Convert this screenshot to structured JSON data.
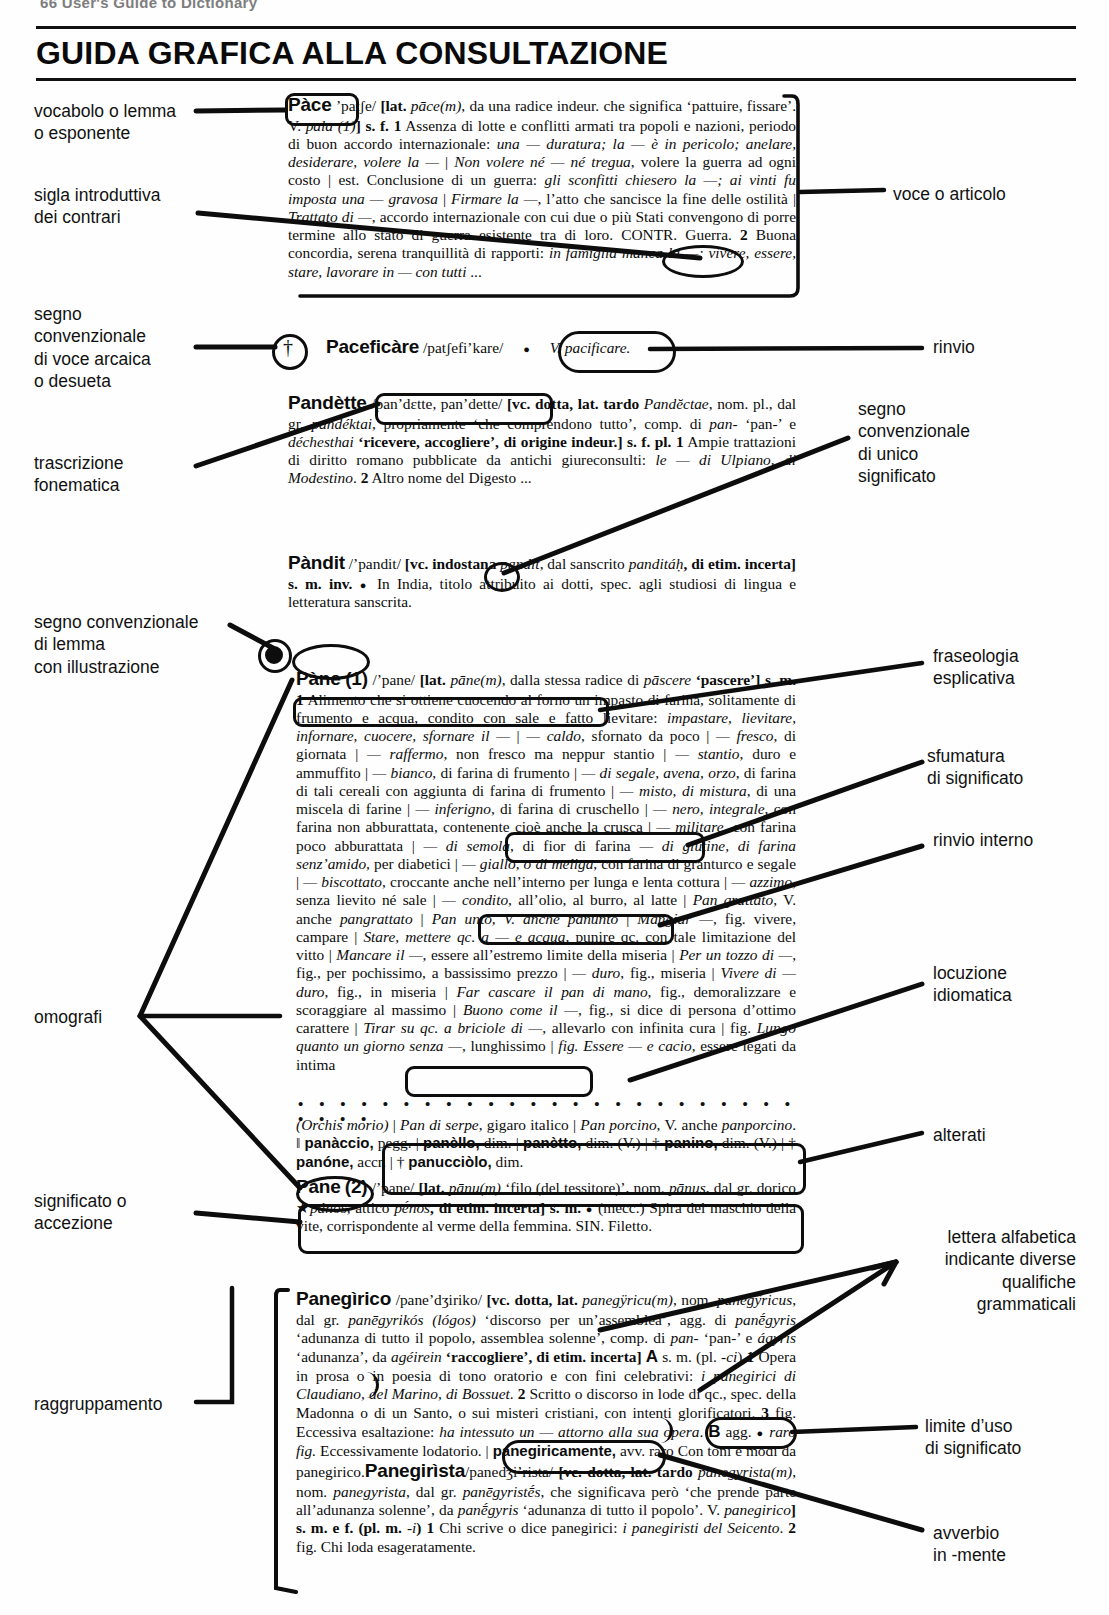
{
  "running_head": {
    "text": "66  User's Guide to Dictionary",
    "folio": ""
  },
  "title": "GUIDA GRAFICA ALLA CONSULTAZIONE",
  "labels_left": [
    {
      "name": "vocabolo-o-lemma",
      "text": "vocabolo o lemma\no esponente"
    },
    {
      "name": "sigla-introduttiva-dei-contrari",
      "text": "sigla introduttiva\ndei contrari"
    },
    {
      "name": "segno-convenzionale-voce-arcaica",
      "text": "segno\nconvenzionale\ndi voce arcaica\no desueta"
    },
    {
      "name": "trascrizione-fonematica",
      "text": "trascrizione\nfonematica"
    },
    {
      "name": "segno-convenzionale-lemma-illustrazione",
      "text": "segno convenzionale\ndi lemma\ncon illustrazione"
    },
    {
      "name": "omografi",
      "text": "omografi"
    },
    {
      "name": "significato-o-accezione",
      "text": "significato o\naccezione"
    },
    {
      "name": "raggruppamento",
      "text": "raggruppamento"
    }
  ],
  "labels_right": [
    {
      "name": "voce-o-articolo",
      "text": "voce o articolo"
    },
    {
      "name": "rinvio",
      "text": "rinvio"
    },
    {
      "name": "segno-convenzionale-unico-significato",
      "text": "segno\nconvenzionale\ndi unico\nsignificato"
    },
    {
      "name": "fraseologia-esplicativa",
      "text": "fraseologia\nesplicativa"
    },
    {
      "name": "sfumatura-di-significato",
      "text": "sfumatura\ndi significato"
    },
    {
      "name": "rinvio-interno",
      "text": "rinvio interno"
    },
    {
      "name": "locuzione-idiomatica",
      "text": "locuzione\nidiomatica"
    },
    {
      "name": "alterati",
      "text": "alterati"
    },
    {
      "name": "lettera-alfabetica-qualifiche",
      "text": "lettera alfabetica\nindicante diverse\nqualifiche\ngrammaticali"
    },
    {
      "name": "limite-duso-di-significato",
      "text": "limite d’uso\ndi significato"
    },
    {
      "name": "avverbio-in-mente",
      "text": "avverbio\nin -mente"
    }
  ],
  "entries": {
    "pace": {
      "headword": "Pàce",
      "pron": "’patʃe/",
      "etym_open": "[lat. ",
      "etym_lat": "pāce(m)",
      "etym_rest": ", da una radice indeur. che significa ‘pattuire, fissare’. V. ",
      "etym_ref": "pala (1)",
      "etym_close": "] s. f. ",
      "s1_num": "1",
      "s1": " Assenza di lotte e conflitti armati tra popoli e nazioni, periodo di buon accordo internazionale: ",
      "s1_ex1": "una — duratura; la — è in pericolo; anelare, desiderare, volere la —",
      "s1_bar1": " | ",
      "s1_ex2": "Non volere né — né tregua",
      "s1_t2": ", volere la guerra ad ogni costo | est. Conclusione di un guerra: ",
      "s1_ex3": "gli sconfitti chiesero la —; ai vinti fu imposta una — gravosa",
      "s1_bar2": " | ",
      "s1_ex4": "Firmare la —",
      "s1_t3": ", l’atto che sancisce la fine delle ostilità | ",
      "s1_ex5": "Trattato di —",
      "s1_t4": ", accordo internazionale con cui due o più Stati convengono di porre termine allo stato di guerra esistente tra di loro. ",
      "contr_sigla": "CONTR.",
      "contr_rest": " Guerra. ",
      "s2_num": "2",
      "s2": " Buona concordia, serena tranquillità di rapporti: ",
      "s2_ex": "in famiglia manca la —; vivere, essere, stare, lavorare in — con tutti",
      "s2_end": " ..."
    },
    "pacificare": {
      "dagger": "†",
      "headword": "Paceficàre",
      "pron": "/patʃefi’kare/",
      "bullet": "●",
      "rinvio": "V. pacificare."
    },
    "pandette": {
      "headword": "Pandètte",
      "pron": "/pan’dɛtte, pan’dette/",
      "etym": " [vc. dotta, lat. tardo ",
      "etym_lat": "Pandĕctae",
      "etym_2": ", nom. pl., dal gr. ",
      "etym_gr": "pandéktai",
      "etym_3": ", propriamente ‘che comprendono tutto’, comp. di ",
      "etym_pan": "pan-",
      "etym_4": " ‘pan-’ e ",
      "etym_dech": "déchesthai",
      "etym_5": " ‘ricevere, accogliere’, di origine indeur.] s. f. pl. ",
      "s1_num": "1",
      "s1": " Ampie trattazioni di diritto romano pubblicate da antichi giureconsulti: ",
      "s1_ex": "le — di Ulpiano, di Modestino",
      "s1_end": ". ",
      "s2_num": "2",
      "s2": " Altro nome del Digesto ..."
    },
    "pandit": {
      "headword": "Pàndit",
      "pron": "/’pandit/",
      "etym": " [vc. indostana ",
      "etym_i": "pandit",
      "etym_2": ", dal sanscrito ",
      "etym_sans": "panditáḥ",
      "etym_3": ", di etim. incerta] s. m. inv. ",
      "bullet": "●",
      "body": " In India, titolo attribuito ai dotti, spec. agli studiosi di lingua e letteratura sanscrita."
    },
    "pane1": {
      "icon": "◉",
      "headword": "Pàne",
      "homograph": "(1)",
      "pron": "/’pane/",
      "etym": " [lat. ",
      "etym_lat": "pāne(m)",
      "etym_2": ", dalla stessa radice di ",
      "etym_pas": "pāscere",
      "etym_3": " ‘pascere’] s. m. ",
      "s1_num": "1",
      "s1": " Alimento che si ottiene cuocendo al forno un impasto di farina, solitamente di frumento e acqua, condito con sale e fatto lievitare: ",
      "fras": "impastare, lievitare, infornare, cuocere, sfornare il —",
      "bar_a": " | ",
      "ex_caldo": "— caldo",
      "t_caldo": ", sfornato da poco | ",
      "ex_fresco": "— fresco",
      "t_fresco": ", di giornata | ",
      "ex_raffermo": "— raffermo",
      "t_raffermo": ", non fresco ma neppur stantio | ",
      "ex_stantio": "— stantio",
      "t_stantio": ", duro e ammuffito | ",
      "ex_bianco": "— bianco",
      "t_bianco": ", di farina di frumento | ",
      "ex_segale": "— di segale, avena, orzo",
      "t_segale": ", di farina di tali cereali con aggiunta di farina di frumento | ",
      "ex_misto": "— misto, di mistura",
      "t_misto": ", di una miscela di farine | ",
      "ex_inferigno": "— inferigno",
      "t_inferigno": ", di farina di cruschello | ",
      "ex_nero": "— nero, integrale",
      "t_nero": ", con farina non abburattata, contenente cioè anche la crusca | ",
      "ex_militare": "— militare",
      "t_militare": ", con farina poco abburattata | ",
      "ex_semola": "— di semola",
      "t_semola": ", di fior di farina ",
      "sfum": "— di glutine, di farina senz’amido,",
      "t_glutine": " per diabetici | ",
      "ex_giallo": "— giallo, o di meliga",
      "t_giallo": ", con farina di granturco e segale | ",
      "ex_bisc": "— biscottato",
      "t_bisc": ", croccante anche nell’interno per lunga e lenta cottura | ",
      "ex_azzimo": "— azzimo",
      "t_azzimo": ", senza lievito né sale | ",
      "ex_condito": "— condito",
      "t_condito": ", all’olio, al burro, al latte | ",
      "ex_grattato": "Pan grattato",
      "t_grattato": ", V. anche ",
      "ref_pangrattato": "pangrattato",
      "bar_b": " | ",
      "rinvio_interno": "Pan unto, V. anche panunto",
      "bar_c": " | ",
      "ex_mangiar": "Mangiar —",
      "t_mangiar": ", fig. vivere, campare | ",
      "ex_stare": "Stare, mettere qc. a — e acqua",
      "t_stare": ", punire qc. con tale limitazione del vitto | ",
      "ex_mancare": "Mancare il —",
      "t_mancare": ", essere all’estremo limite della miseria | ",
      "ex_tozzo": "Per un tozzo di —",
      "t_tozzo": ", fig., per pochissimo, a bassissimo prezzo | ",
      "ex_duro": "— duro",
      "t_duro": ", fig., miseria | ",
      "ex_vivere": "Vivere di — duro",
      "t_vivere": ", fig., in miseria | ",
      "ex_cascare": "Far cascare il pan di mano",
      "t_cascare": ", fig., demoralizzare e scoraggiare al massimo | ",
      "ex_buono": "Buono come il —",
      "t_buono": ", fig., si dice di persona d’ottimo carattere | ",
      "ex_tirar": "Tirar su qc. a briciole di —",
      "t_tirar": ", allevarlo con infinita cura | fig. ",
      "ex_lungo": "Lungo quanto un giorno senza —",
      "t_lungo": ", lunghissimo | ",
      "idiom": "fig. Essere — e cacio,",
      "t_idiom": " essere legati da intima",
      "cont_orchis": "(Orchis morio)",
      "cont_1": " | ",
      "cont_serpe": "Pan di serpe",
      "cont_2": ", gigaro italico | ",
      "cont_porcino": "Pan porcino",
      "cont_3": ", V. anche ",
      "cont_panporcino": "panporcino",
      "cont_4": ". ‖ ",
      "alt_1": "panàccio,",
      "alt_1t": " pegg. | ",
      "alt_2": "panèllo,",
      "alt_2t": " dim. | ",
      "alt_3": "panètto,",
      "alt_3t": " dim. (V.) | † ",
      "alt_4": "panino,",
      "alt_4t": " dim. (V.) | † ",
      "alt_5": "panóne,",
      "alt_5t": " accr. | † ",
      "alt_6": "panucciòlo,",
      "alt_6t": " dim."
    },
    "pane2": {
      "headword": "Pàne",
      "homograph": "(2)",
      "pron": "/’pane/",
      "etym": " [lat. ",
      "etym_lat": "pānu(m)",
      "etym_2": " ‘filo (del tessitore)’, nom. ",
      "etym_nom": "pānus",
      "etym_3": ", dal gr. dorico ★",
      "etym_gr1": "pános",
      "etym_4": ", attico ",
      "etym_gr2": "pḗnos",
      "etym_5": ", di etim. incerta] s. m. ",
      "bullet": "●",
      "significato": " (mecc.) Spira del maschio della vite, corrispondente al verme della femmina.",
      "sn": " SIN. Filetto."
    },
    "panegirico": {
      "headword": "Panegìrico",
      "pron": "/pane’dʒiriko/",
      "etym": " [vc. dotta, lat. ",
      "etym_lat": "panegÿricu(m)",
      "etym_2": ", nom. ",
      "etym_nom": "panegÿricus",
      "etym_3": ", dal gr. ",
      "etym_gr": "panēgyrikós (lógos)",
      "etym_4": " ‘discorso per un’assemblea’, agg. di ",
      "etym_gr2": "panḗgyris",
      "etym_5": " ‘adunanza di tutto il popolo, assemblea solenne’, comp. di ",
      "etym_pan": "pan-",
      "etym_6": " ‘pan-’ e ",
      "etym_ag": "ágyris",
      "etym_7": " ‘adunanza’, da ",
      "etym_ageirein": "agéirein",
      "etym_8": " ‘raccogliere’, di etim. incerta] ",
      "letter_a": "A",
      "a_gram": " s. m. (pl. ",
      "a_pl": "-ci",
      "a_gram2": ") ",
      "s1_num": "1",
      "s1": " Opera in prosa o in poesia di tono oratorio e con fini celebrativi: ",
      "s1_ex": "i panegirici di Claudiano, del Marino, di Bossuet",
      "s1_end": ". ",
      "s2_num": "2",
      "s2": " Scritto o discorso in lode di qc., spec. della Madonna o di un Santo, o sui misteri cristiani, con intenti glorificatori. ",
      "s3_num": "3",
      "s3": " fig. Eccessiva esaltazione: ",
      "s3_ex": "ha intessuto un — attorno alla sua opera",
      "s3_end": ". ",
      "letter_b": "B",
      "b_gram": " agg. ",
      "bullet": "●",
      "limite": " raro fig.",
      "b_def": " Eccessivamente lodatorio. | ",
      "avverbio": "panegiricamente,",
      "avv_rest": " avv. raro Con toni e modi da panegirico."
    },
    "panegirista": {
      "headword": "Panegirìsta",
      "pron": "/panedʒi’rista/",
      "etym": " [vc. dotta, lat. tardo ",
      "etym_lat": "panegyrista(m)",
      "etym_2": ", nom. ",
      "etym_nom": "panegyrista",
      "etym_3": ", dal gr. ",
      "etym_gr": "panēgyristḗs",
      "etym_4": ", che significava però ‘che prende parte all’adunanza solenne’, da ",
      "etym_gr2": "panḗgyris",
      "etym_5": " ‘adunanza di tutto il popolo’. V. ",
      "etym_ref": "panegirico",
      "etym_6": "] s. m. e f. (pl. m. ",
      "etym_pl": "-i",
      "etym_7": ") ",
      "s1_num": "1",
      "s1": " Chi scrive o dice panegirici: ",
      "s1_ex": "i panegiristi del Seicento",
      "s1_end": ". ",
      "s2_num": "2",
      "s2": " fig. Chi loda esageratamente."
    }
  }
}
